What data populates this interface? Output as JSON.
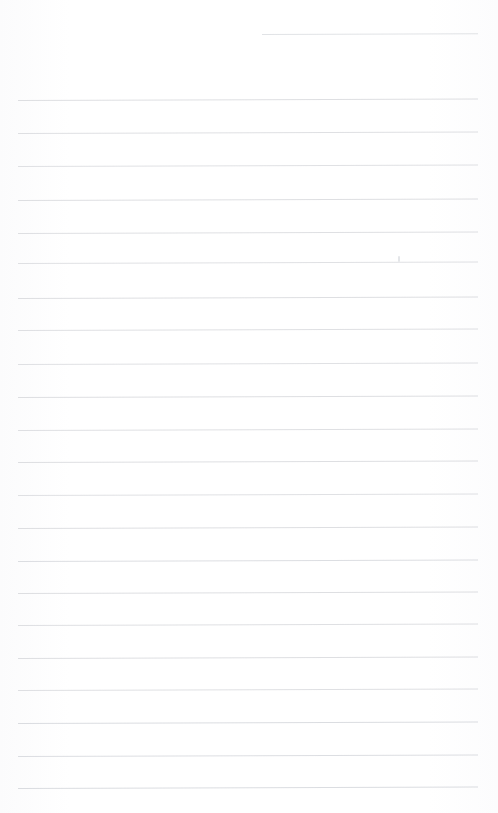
{
  "document": {
    "type": "lined-paper",
    "title": "Blank ruled notebook page",
    "page_width": 498,
    "page_height": 813,
    "background_color": "#fefefe",
    "rule_color": "#c9ccd1",
    "text_content": "",
    "handwriting_present": false
  },
  "ruling": {
    "line_count": 23,
    "line_spacing": 32.8,
    "left_margin": 18,
    "right_margin": 478,
    "line_thickness": 1,
    "skew_degrees": -0.18,
    "first_line_y": 34,
    "last_line_y": 787
  },
  "lines": [
    {
      "index": 1,
      "y": 34,
      "x_start": 262,
      "x_end": 478,
      "opacity": 0.55,
      "partial": true
    },
    {
      "index": 2,
      "y": 99.5,
      "x_start": 18,
      "x_end": 478,
      "opacity": 0.62,
      "partial": false
    },
    {
      "index": 3,
      "y": 132.5,
      "x_start": 18,
      "x_end": 478,
      "opacity": 0.6,
      "partial": false
    },
    {
      "index": 4,
      "y": 166,
      "x_start": 18,
      "x_end": 478,
      "opacity": 0.58,
      "partial": false
    },
    {
      "index": 5,
      "y": 199.5,
      "x_start": 18,
      "x_end": 478,
      "opacity": 0.62,
      "partial": false
    },
    {
      "index": 6,
      "y": 232.5,
      "x_start": 18,
      "x_end": 478,
      "opacity": 0.6,
      "partial": false
    },
    {
      "index": 7,
      "y": 263,
      "x_start": 18,
      "x_end": 478,
      "opacity": 0.58,
      "partial": false
    },
    {
      "index": 8,
      "y": 297.5,
      "x_start": 18,
      "x_end": 478,
      "opacity": 0.62,
      "partial": false
    },
    {
      "index": 9,
      "y": 330,
      "x_start": 18,
      "x_end": 478,
      "opacity": 0.6,
      "partial": false
    },
    {
      "index": 10,
      "y": 363.5,
      "x_start": 18,
      "x_end": 478,
      "opacity": 0.58,
      "partial": false
    },
    {
      "index": 11,
      "y": 397,
      "x_start": 18,
      "x_end": 478,
      "opacity": 0.62,
      "partial": false
    },
    {
      "index": 12,
      "y": 429.5,
      "x_start": 18,
      "x_end": 478,
      "opacity": 0.6,
      "partial": false
    },
    {
      "index": 13,
      "y": 462,
      "x_start": 18,
      "x_end": 478,
      "opacity": 0.62,
      "partial": false
    },
    {
      "index": 14,
      "y": 495,
      "x_start": 18,
      "x_end": 478,
      "opacity": 0.58,
      "partial": false
    },
    {
      "index": 15,
      "y": 528,
      "x_start": 18,
      "x_end": 478,
      "opacity": 0.62,
      "partial": false
    },
    {
      "index": 16,
      "y": 560.5,
      "x_start": 18,
      "x_end": 478,
      "opacity": 0.64,
      "partial": false
    },
    {
      "index": 17,
      "y": 592.5,
      "x_start": 18,
      "x_end": 478,
      "opacity": 0.62,
      "partial": false
    },
    {
      "index": 18,
      "y": 625,
      "x_start": 18,
      "x_end": 478,
      "opacity": 0.6,
      "partial": false
    },
    {
      "index": 19,
      "y": 657.5,
      "x_start": 18,
      "x_end": 478,
      "opacity": 0.62,
      "partial": false
    },
    {
      "index": 20,
      "y": 690,
      "x_start": 18,
      "x_end": 478,
      "opacity": 0.6,
      "partial": false
    },
    {
      "index": 21,
      "y": 723,
      "x_start": 18,
      "x_end": 478,
      "opacity": 0.66,
      "partial": false
    },
    {
      "index": 22,
      "y": 755.5,
      "x_start": 18,
      "x_end": 478,
      "opacity": 0.64,
      "partial": false
    },
    {
      "index": 23,
      "y": 787.5,
      "x_start": 18,
      "x_end": 478,
      "opacity": 0.66,
      "partial": false
    }
  ],
  "marks": [
    {
      "name": "ink-speck",
      "x": 398,
      "y": 256,
      "width": 2,
      "height": 6,
      "color": "#e4e6e9"
    }
  ]
}
